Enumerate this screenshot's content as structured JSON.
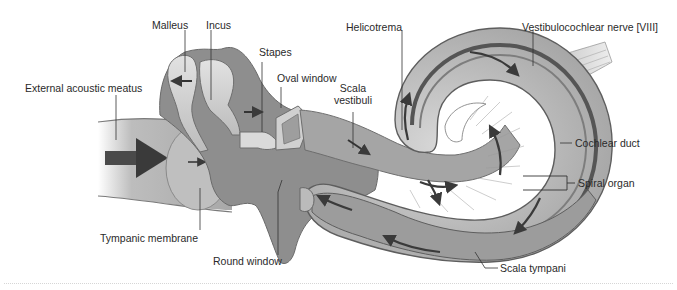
{
  "figure": {
    "type": "anatomical-diagram",
    "labels": {
      "malleus": "Malleus",
      "incus": "Incus",
      "stapes": "Stapes",
      "oval_window": "Oval window",
      "external_acoustic_meatus": "External acoustic meatus",
      "scala_vestibuli_line1": "Scala",
      "scala_vestibuli_line2": "vestibuli",
      "helicotrema": "Helicotrema",
      "vestibulocochlear_nerve": "Vestibulocochlear nerve [VIII]",
      "cochlear_duct": "Cochlear duct",
      "spiral_organ": "Spiral organ",
      "tympanic_membrane": "Tympanic membrane",
      "round_window": "Round window",
      "scala_tympani": "Scala tympani"
    },
    "colors": {
      "background": "#ffffff",
      "tissue_light": "#c9c9c9",
      "tissue_mid": "#9a9a9a",
      "tissue_dark": "#6e6e6e",
      "cavity": "#8a8a8a",
      "bone": "#d4d4d4",
      "arrow": "#3a3a3a",
      "leader_line": "#333333",
      "text": "#2a2a2a"
    }
  }
}
